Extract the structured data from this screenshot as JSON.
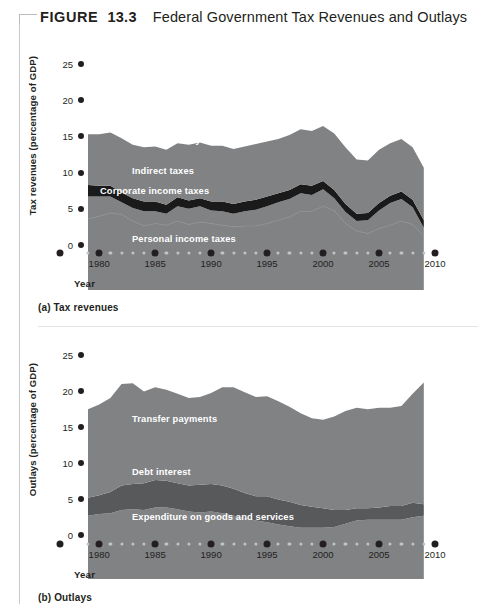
{
  "figure": {
    "label_word": "FIGURE",
    "number": "13.3",
    "title": "Federal Government Tax Revenues and Outlays"
  },
  "colors": {
    "area_light": "#808284",
    "band_dark_a": "#1a1a1a",
    "band_dark_b": "#58595b",
    "divider_faint": "#8b8d8f",
    "text": "#231f20",
    "label_text": "#ffffff",
    "tick_major": "#231f20",
    "tick_minor": "#c2c5c7",
    "rule": "#c7cacc"
  },
  "panels": [
    {
      "id": "a",
      "caption": "(a) Tax revenues",
      "ylabel": "Tax revenues (percentage of GDP)",
      "xlabel": "Year",
      "yticks": [
        25,
        20,
        15,
        10,
        5,
        0
      ],
      "xticks_major": [
        1980,
        1985,
        1990,
        1995,
        2000,
        2005,
        2010
      ],
      "series_labels": [
        {
          "text": "Social Security taxes",
          "x": 132,
          "y": 135
        },
        {
          "text": "Indirect taxes",
          "x": 132,
          "y": 166
        },
        {
          "text": "Corporate income taxes",
          "x": 100,
          "y": 186
        },
        {
          "text": "Personal income taxes",
          "x": 132,
          "y": 234
        }
      ]
    },
    {
      "id": "b",
      "caption": "(b) Outlays",
      "ylabel": "Outlays (percentage of GDP)",
      "xlabel": "Year",
      "yticks": [
        25,
        20,
        15,
        10,
        5,
        0
      ],
      "xticks_major": [
        1980,
        1985,
        1990,
        1995,
        2000,
        2005,
        2010
      ],
      "series_labels": [
        {
          "text": "Transfer payments",
          "x": 132,
          "y": 414
        },
        {
          "text": "Debt interest",
          "x": 132,
          "y": 467
        },
        {
          "text": "Expenditure on goods and services",
          "x": 132,
          "y": 512
        }
      ]
    }
  ],
  "chart_data": [
    {
      "type": "area",
      "panel": "a",
      "title": "(a) Tax revenues",
      "xlabel": "Year",
      "ylabel": "Tax revenues (percentage of GDP)",
      "xlim": [
        1979,
        2010
      ],
      "ylim": [
        0,
        25
      ],
      "yticks": [
        0,
        5,
        10,
        15,
        20,
        25
      ],
      "xticks": [
        1980,
        1985,
        1990,
        1995,
        2000,
        2005,
        2010
      ],
      "grid": false,
      "legend": "inline-labels",
      "stacked": true,
      "x": [
        1979,
        1980,
        1981,
        1982,
        1983,
        1984,
        1985,
        1986,
        1987,
        1988,
        1989,
        1990,
        1991,
        1992,
        1993,
        1994,
        1995,
        1996,
        1997,
        1998,
        1999,
        2000,
        2001,
        2002,
        2003,
        2004,
        2005,
        2006,
        2007,
        2008,
        2009
      ],
      "series": [
        {
          "name": "Personal income taxes",
          "values": [
            8.7,
            9.0,
            9.4,
            9.2,
            8.4,
            7.8,
            8.1,
            7.9,
            8.4,
            8.0,
            8.3,
            8.1,
            7.9,
            7.7,
            7.8,
            7.8,
            8.1,
            8.5,
            8.9,
            9.6,
            9.6,
            10.2,
            9.7,
            8.1,
            7.2,
            6.9,
            7.5,
            7.9,
            8.4,
            8.0,
            6.6
          ]
        },
        {
          "name": "Corporate income taxes",
          "values": [
            2.7,
            2.4,
            2.0,
            1.5,
            1.6,
            1.8,
            1.5,
            1.4,
            1.8,
            1.9,
            1.9,
            1.6,
            1.7,
            1.6,
            1.8,
            2.0,
            2.1,
            2.2,
            2.2,
            2.2,
            2.0,
            2.1,
            1.5,
            1.4,
            1.2,
            1.6,
            2.2,
            2.7,
            2.7,
            2.1,
            1.0
          ]
        },
        {
          "name": "Indirect taxes",
          "values": [
            1.4,
            1.3,
            1.3,
            1.2,
            1.2,
            1.2,
            1.2,
            1.1,
            1.1,
            1.0,
            1.0,
            1.1,
            1.2,
            1.2,
            1.2,
            1.2,
            1.2,
            1.1,
            1.1,
            1.1,
            1.1,
            1.0,
            1.0,
            1.0,
            0.9,
            0.9,
            0.9,
            0.9,
            0.9,
            0.9,
            0.9
          ]
        },
        {
          "name": "Social Security taxes",
          "values": [
            6.2,
            6.3,
            6.5,
            6.6,
            6.5,
            6.6,
            6.7,
            6.7,
            6.6,
            6.8,
            6.8,
            6.8,
            6.8,
            6.7,
            6.7,
            6.8,
            6.7,
            6.6,
            6.7,
            6.7,
            6.7,
            6.7,
            6.9,
            6.9,
            6.6,
            6.4,
            6.5,
            6.4,
            6.4,
            6.4,
            6.4
          ]
        }
      ]
    },
    {
      "type": "area",
      "panel": "b",
      "title": "(b) Outlays",
      "xlabel": "Year",
      "ylabel": "Outlays (percentage of GDP)",
      "xlim": [
        1979,
        2010
      ],
      "ylim": [
        0,
        25
      ],
      "yticks": [
        0,
        5,
        10,
        15,
        20,
        25
      ],
      "xticks": [
        1980,
        1985,
        1990,
        1995,
        2000,
        2005,
        2010
      ],
      "grid": false,
      "legend": "inline-labels",
      "stacked": true,
      "x": [
        1979,
        1980,
        1981,
        1982,
        1983,
        1984,
        1985,
        1986,
        1987,
        1988,
        1989,
        1990,
        1991,
        1992,
        1993,
        1994,
        1995,
        1996,
        1997,
        1998,
        1999,
        2000,
        2001,
        2002,
        2003,
        2004,
        2005,
        2006,
        2007,
        2008,
        2009
      ],
      "series": [
        {
          "name": "Expenditure on goods and services",
          "values": [
            7.8,
            8.0,
            8.1,
            8.5,
            8.6,
            8.5,
            8.8,
            8.8,
            8.6,
            8.3,
            8.2,
            8.3,
            8.1,
            7.8,
            7.5,
            7.2,
            7.0,
            6.7,
            6.5,
            6.3,
            6.3,
            6.3,
            6.4,
            6.8,
            7.2,
            7.3,
            7.3,
            7.3,
            7.3,
            7.6,
            7.8
          ]
        },
        {
          "name": "Debt interest",
          "values": [
            2.2,
            2.3,
            2.6,
            3.0,
            3.1,
            3.3,
            3.4,
            3.3,
            3.2,
            3.2,
            3.4,
            3.4,
            3.4,
            3.3,
            3.1,
            3.0,
            3.2,
            3.1,
            3.0,
            2.8,
            2.6,
            2.4,
            2.1,
            1.7,
            1.5,
            1.4,
            1.5,
            1.7,
            1.7,
            1.8,
            1.4
          ]
        },
        {
          "name": "Transfer payments",
          "values": [
            10.9,
            11.2,
            11.6,
            12.5,
            12.4,
            11.3,
            11.4,
            11.2,
            11.0,
            10.8,
            10.8,
            11.2,
            12.1,
            12.5,
            12.4,
            12.2,
            12.3,
            12.1,
            11.7,
            11.3,
            10.9,
            10.9,
            11.5,
            12.2,
            12.4,
            12.2,
            12.3,
            12.1,
            12.3,
            13.4,
            15.0
          ]
        }
      ]
    }
  ]
}
